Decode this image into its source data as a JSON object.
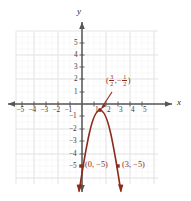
{
  "chart_data": {
    "type": "line",
    "title": "",
    "xlabel": "x",
    "ylabel": "y",
    "xlim": [
      -5.5,
      5.5
    ],
    "ylim": [
      -5.5,
      5.5
    ],
    "grid": true,
    "legend": false,
    "x_ticks": [
      "-5",
      "-4",
      "-3",
      "-2",
      "-1",
      "1",
      "2",
      "3",
      "4",
      "5"
    ],
    "y_ticks": [
      "5",
      "4",
      "3",
      "2",
      "1",
      "-1",
      "-2",
      "-3",
      "-4",
      "-5"
    ],
    "curve": {
      "name": "parabola",
      "equation_form": "downward parabola through (0,-5) and (3,-5) with vertex (3/2, -1/2)",
      "color": "#8c2b1b",
      "vertex": [
        1.5,
        -0.5
      ],
      "points": [
        [
          0,
          -5
        ],
        [
          3,
          -5
        ]
      ],
      "opens": "down"
    },
    "annotations": [
      {
        "name": "vertex-label",
        "text_plain": "(3/2, -1/2)",
        "open_paren": "(",
        "num1": "3",
        "den1": "2",
        "comma": ", ",
        "minus": "−",
        "num2": "1",
        "den2": "2",
        "close_paren": ")",
        "has_arrow": true,
        "color": "#8c2b1b"
      },
      {
        "name": "point-label-left",
        "text": "(0, −5)",
        "color": "#8c2b1b"
      },
      {
        "name": "point-label-right",
        "text": "(3, −5)",
        "color": "#8c2b1b"
      }
    ],
    "colors": {
      "curve": "#8c2b1b",
      "axis": "#565656",
      "grid": "#e8e8e8",
      "grid_minor": "#f2f2f2",
      "tick_text": "#3a3a3a",
      "background": "#ffffff"
    }
  },
  "axes": {
    "x_name": "x",
    "y_name": "y"
  },
  "x_tick_labels": [
    {
      "v": "-5",
      "px": 22
    },
    {
      "v": "-4",
      "px": 34
    },
    {
      "v": "-3",
      "px": 46
    },
    {
      "v": "-2",
      "px": 58
    },
    {
      "v": "-1",
      "px": 70
    },
    {
      "v": "1",
      "px": 97
    },
    {
      "v": "2",
      "px": 109
    },
    {
      "v": "3",
      "px": 121
    },
    {
      "v": "4",
      "px": 133
    },
    {
      "v": "5",
      "px": 145
    }
  ],
  "y_tick_labels": [
    {
      "v": "5",
      "py": 43
    },
    {
      "v": "4",
      "py": 55
    },
    {
      "v": "3",
      "py": 67
    },
    {
      "v": "2",
      "py": 79
    },
    {
      "v": "1",
      "py": 92
    },
    {
      "v": "-1",
      "py": 116
    },
    {
      "v": "-2",
      "py": 129
    },
    {
      "v": "-3",
      "py": 141
    },
    {
      "v": "-4",
      "py": 154
    },
    {
      "v": "-5",
      "py": 166
    }
  ]
}
